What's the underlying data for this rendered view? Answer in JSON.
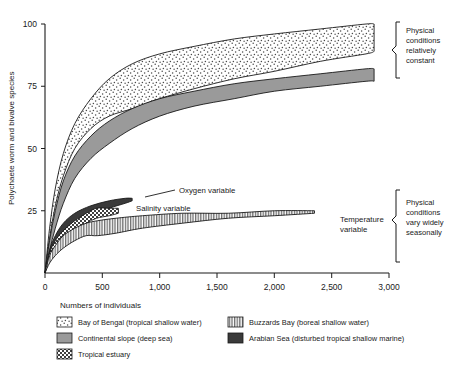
{
  "chart_data": {
    "type": "area",
    "title": "",
    "xlabel": "Numbers of individuals",
    "ylabel": "Polychaete worm and bivalve species",
    "xlim": [
      0,
      3000
    ],
    "ylim": [
      0,
      100
    ],
    "xticks": [
      0,
      500,
      1000,
      1500,
      2000,
      2500,
      3000
    ],
    "xtick_labels": [
      "0",
      "500",
      "1,000",
      "1,500",
      "2,000",
      "2,500",
      "3,000"
    ],
    "yticks": [
      0,
      25,
      50,
      75,
      100
    ],
    "ytick_labels": [
      "0",
      "25",
      "50",
      "75",
      "100"
    ],
    "grid": false,
    "legend_position": "below-axes",
    "series": [
      {
        "name": "Bay of Bengal (tropical shallow water)",
        "pattern": "fine-stipple",
        "color": "#ffffff",
        "upper": [
          [
            0,
            0
          ],
          [
            40,
            18
          ],
          [
            90,
            34
          ],
          [
            160,
            48
          ],
          [
            260,
            60
          ],
          [
            400,
            70
          ],
          [
            560,
            78
          ],
          [
            760,
            84
          ],
          [
            1000,
            88
          ],
          [
            1300,
            91
          ],
          [
            1650,
            94
          ],
          [
            2000,
            96
          ],
          [
            2400,
            98
          ],
          [
            2800,
            100
          ],
          [
            2870,
            100
          ]
        ],
        "lower": [
          [
            0,
            0
          ],
          [
            40,
            14
          ],
          [
            90,
            27
          ],
          [
            160,
            39
          ],
          [
            260,
            50
          ],
          [
            400,
            58
          ],
          [
            560,
            63
          ],
          [
            760,
            66
          ],
          [
            1000,
            70
          ],
          [
            1300,
            74
          ],
          [
            1650,
            78
          ],
          [
            2000,
            81
          ],
          [
            2400,
            85
          ],
          [
            2800,
            88
          ],
          [
            2870,
            89
          ]
        ]
      },
      {
        "name": "Continental slope (deep sea)",
        "pattern": "solid-gray",
        "color": "#9a9a9a",
        "upper": [
          [
            0,
            0
          ],
          [
            40,
            13
          ],
          [
            90,
            25
          ],
          [
            160,
            37
          ],
          [
            260,
            47
          ],
          [
            400,
            55
          ],
          [
            560,
            61
          ],
          [
            760,
            66
          ],
          [
            1000,
            70
          ],
          [
            1300,
            73
          ],
          [
            1650,
            76
          ],
          [
            2000,
            78
          ],
          [
            2400,
            80
          ],
          [
            2800,
            82
          ],
          [
            2870,
            82
          ]
        ],
        "lower": [
          [
            0,
            0
          ],
          [
            40,
            9
          ],
          [
            90,
            18
          ],
          [
            160,
            28
          ],
          [
            260,
            38
          ],
          [
            400,
            46
          ],
          [
            560,
            52
          ],
          [
            760,
            58
          ],
          [
            1000,
            63
          ],
          [
            1300,
            67
          ],
          [
            1650,
            70
          ],
          [
            2000,
            73
          ],
          [
            2400,
            75
          ],
          [
            2800,
            77
          ],
          [
            2870,
            77
          ]
        ]
      },
      {
        "name": "Arabian Sea (disturbed tropical shallow marine)",
        "pattern": "solid-dark",
        "color": "#3a3a3a",
        "upper": [
          [
            0,
            0
          ],
          [
            40,
            9
          ],
          [
            90,
            15
          ],
          [
            160,
            20
          ],
          [
            260,
            24
          ],
          [
            400,
            27
          ],
          [
            560,
            29
          ],
          [
            700,
            30
          ],
          [
            760,
            30
          ]
        ],
        "lower": [
          [
            0,
            0
          ],
          [
            40,
            7
          ],
          [
            90,
            12
          ],
          [
            160,
            16
          ],
          [
            260,
            20
          ],
          [
            400,
            23
          ],
          [
            560,
            26
          ],
          [
            700,
            28
          ],
          [
            760,
            29
          ]
        ]
      },
      {
        "name": "Tropical estuary",
        "pattern": "checker",
        "color": "#ffffff",
        "upper": [
          [
            0,
            0
          ],
          [
            40,
            8
          ],
          [
            90,
            13
          ],
          [
            160,
            17
          ],
          [
            260,
            21
          ],
          [
            360,
            24
          ],
          [
            450,
            26
          ],
          [
            560,
            26
          ],
          [
            640,
            26
          ]
        ],
        "lower": [
          [
            0,
            0
          ],
          [
            40,
            6
          ],
          [
            90,
            10
          ],
          [
            160,
            14
          ],
          [
            260,
            17
          ],
          [
            360,
            20
          ],
          [
            450,
            22
          ],
          [
            560,
            23
          ],
          [
            640,
            24
          ]
        ]
      },
      {
        "name": "Buzzards Bay (boreal shallow water)",
        "pattern": "vertical-stripes",
        "color": "#ffffff",
        "upper": [
          [
            0,
            0
          ],
          [
            40,
            7
          ],
          [
            90,
            11
          ],
          [
            160,
            15
          ],
          [
            260,
            18
          ],
          [
            360,
            20
          ],
          [
            460,
            21
          ],
          [
            620,
            22
          ],
          [
            850,
            23
          ],
          [
            1200,
            24
          ],
          [
            1600,
            24
          ],
          [
            2000,
            25
          ],
          [
            2350,
            25
          ]
        ],
        "lower": [
          [
            0,
            0
          ],
          [
            40,
            4
          ],
          [
            90,
            7
          ],
          [
            160,
            10
          ],
          [
            260,
            13
          ],
          [
            360,
            15
          ],
          [
            460,
            15
          ],
          [
            620,
            16
          ],
          [
            850,
            18
          ],
          [
            1200,
            20
          ],
          [
            1600,
            22
          ],
          [
            2000,
            23
          ],
          [
            2350,
            24
          ]
        ]
      }
    ],
    "annotations": [
      {
        "id": "oxygen",
        "text": "Oxygen variable",
        "target_x": 640,
        "target_y": 30
      },
      {
        "id": "salinity",
        "text": "Salinity variable",
        "target_x": 560,
        "target_y": 26
      },
      {
        "id": "temperature",
        "text": "Temperature variable",
        "line1": "Temperature",
        "line2": "variable",
        "target_x": 2350,
        "target_y": 25
      }
    ],
    "brackets": [
      {
        "id": "upper",
        "line1": "Physical",
        "line2": "conditions",
        "line3": "relatively",
        "line4": "constant"
      },
      {
        "id": "lower",
        "line1": "Physical",
        "line2": "conditions",
        "line3": "vary widely",
        "line4": "seasonally"
      }
    ]
  },
  "legend": {
    "items": [
      {
        "label": "Bay of Bengal (tropical shallow water)",
        "pattern": "fine-stipple"
      },
      {
        "label": "Buzzards Bay (boreal shallow water)",
        "pattern": "vertical-stripes"
      },
      {
        "label": "Continental slope (deep sea)",
        "pattern": "solid-gray"
      },
      {
        "label": "Arabian Sea (disturbed tropical shallow marine)",
        "pattern": "solid-dark"
      },
      {
        "label": "Tropical estuary",
        "pattern": "checker"
      }
    ]
  }
}
